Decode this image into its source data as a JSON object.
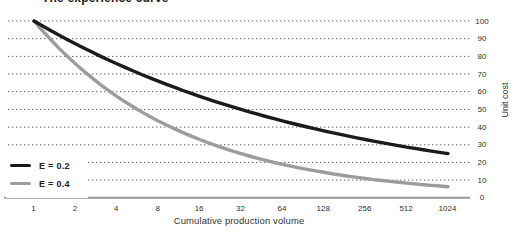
{
  "chart_data": {
    "type": "line",
    "title": "The experience curve",
    "xlabel": "Cumulative production volume",
    "ylabel": "Unit cost",
    "x_scale": "log2",
    "x_ticks": [
      1,
      2,
      4,
      8,
      16,
      32,
      64,
      128,
      256,
      512,
      1024
    ],
    "y_ticks": [
      100,
      90,
      80,
      70,
      60,
      50,
      40,
      30,
      20,
      10,
      0
    ],
    "ylim": [
      0,
      100
    ],
    "grid": "horizontal-dotted",
    "legend_position": "bottom-left",
    "colors": {
      "gridline": "#4d4d4d",
      "zero_axis": "#999999",
      "text": "#2f2f2f"
    },
    "series": [
      {
        "name": "E = 0.2",
        "color": "#1b1b1b",
        "values": [
          100,
          87.1,
          75.8,
          66.0,
          57.4,
          50.0,
          43.5,
          37.9,
          33.0,
          28.7,
          25.0
        ]
      },
      {
        "name": "E = 0.4",
        "color": "#9c9c9c",
        "values": [
          100,
          75.8,
          57.4,
          43.5,
          33.0,
          25.0,
          18.9,
          14.4,
          10.9,
          8.3,
          6.3
        ]
      }
    ]
  }
}
